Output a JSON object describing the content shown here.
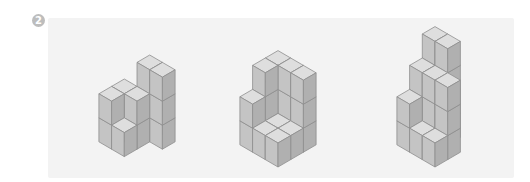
{
  "problem": {
    "number": "2"
  },
  "colors": {
    "top": "#dedede",
    "left": "#c4c4c4",
    "right": "#b0b0b0",
    "edge": "#8e8e8e",
    "panel": "#f3f3f3",
    "badge": "#bdbdbd"
  },
  "geometry": {
    "w": 12.7,
    "h": 7.4,
    "v": 24
  },
  "figures": [
    {
      "name": "figure-1",
      "bottom_x": 137,
      "bottom_y": 164,
      "heightmap": [
        [
          0,
          3,
          3
        ],
        [
          2,
          2,
          0
        ],
        [
          2,
          1,
          0
        ]
      ]
    },
    {
      "name": "figure-2",
      "bottom_x": 278,
      "bottom_y": 167,
      "heightmap": [
        [
          3,
          3,
          3
        ],
        [
          3,
          1,
          1
        ],
        [
          2,
          1,
          1
        ]
      ]
    },
    {
      "name": "figure-3",
      "bottom_x": 435,
      "bottom_y": 167,
      "heightmap": [
        [
          4,
          4,
          0
        ],
        [
          3,
          3,
          3
        ],
        [
          2,
          1,
          1
        ]
      ]
    }
  ]
}
